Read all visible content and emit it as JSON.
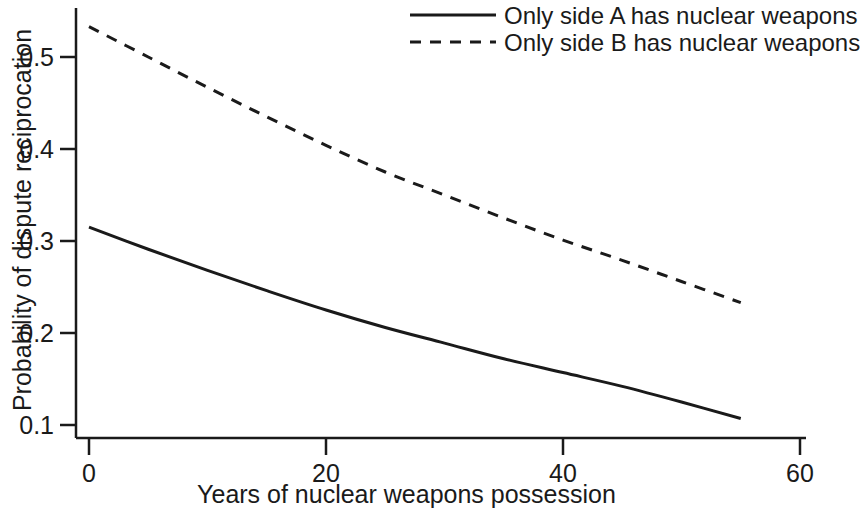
{
  "chart_data": {
    "type": "line",
    "title": "",
    "subtitle": "",
    "xlabel": "Years of nuclear weapons possession",
    "ylabel": "Probability of dispute reciprocation",
    "xlim": [
      0,
      60
    ],
    "ylim": [
      0.1,
      0.54
    ],
    "xticks": [
      0,
      20,
      40,
      60
    ],
    "xtick_labels": [
      "0",
      "20",
      "40",
      "60"
    ],
    "yticks": [
      0.1,
      0.2,
      0.3,
      0.4,
      0.5
    ],
    "ytick_labels": [
      "0.1",
      "0.2",
      "0.3",
      "0.4",
      "0.5"
    ],
    "grid": false,
    "legend_position": "top-right",
    "x": [
      0,
      5,
      10,
      15,
      20,
      25,
      30,
      35,
      40,
      45,
      50,
      55
    ],
    "series": [
      {
        "name": "Only side A has nuclear weapons",
        "style": "solid",
        "color": "#1a1a1a",
        "values": [
          0.315,
          0.291,
          0.268,
          0.246,
          0.225,
          0.206,
          0.189,
          0.172,
          0.157,
          0.142,
          0.125,
          0.107
        ]
      },
      {
        "name": "Only side B has nuclear weapons",
        "style": "dashed",
        "color": "#1a1a1a",
        "values": [
          0.533,
          0.5,
          0.467,
          0.435,
          0.404,
          0.375,
          0.35,
          0.325,
          0.301,
          0.279,
          0.256,
          0.233
        ]
      }
    ]
  },
  "axes": {
    "x_title": "Years of nuclear weapons possession",
    "y_title": "Probability of dispute reciprocation",
    "x_tick_labels": [
      "0",
      "20",
      "40",
      "60"
    ],
    "y_tick_labels": [
      "0.1",
      "0.2",
      "0.3",
      "0.4",
      "0.5"
    ]
  },
  "legend": {
    "entries": [
      {
        "label": "Only side A has nuclear weapons",
        "style": "solid"
      },
      {
        "label": "Only side B has nuclear weapons",
        "style": "dashed"
      }
    ]
  }
}
